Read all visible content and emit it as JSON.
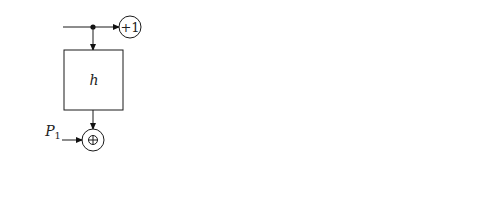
{
  "diagram": {
    "type": "CTR-like keyed hash stream cipher block diagram",
    "key_label_cjk": "鍵",
    "key_label": "Key",
    "increment_label": "+1",
    "function_label": "h",
    "xor_symbol": "⊕",
    "ellipsis": "···",
    "blocks": [
      {
        "index": "1",
        "input_main": "P",
        "input_alt": "C",
        "output_main": "C",
        "output_alt": "P"
      },
      {
        "index": "2",
        "input_main": "P",
        "input_alt": "C",
        "output_main": "C",
        "output_alt": "P"
      },
      {
        "index": "3",
        "input_main": "P",
        "input_alt": "C",
        "output_main": "C",
        "output_alt": "P"
      },
      {
        "index": "k",
        "input_main": "P",
        "input_alt": "C",
        "output_main": "C",
        "output_alt": "P"
      }
    ]
  }
}
